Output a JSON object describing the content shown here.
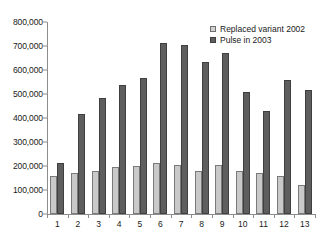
{
  "chart_data": {
    "type": "bar",
    "title": "",
    "subtitle": "",
    "xlabel": "",
    "ylabel": "",
    "categories": [
      "1",
      "2",
      "3",
      "4",
      "5",
      "6",
      "7",
      "8",
      "9",
      "10",
      "11",
      "12",
      "13"
    ],
    "series": [
      {
        "name": "Replaced variant 2002",
        "color": "#c9c9c9",
        "values": [
          160000,
          170000,
          178000,
          195000,
          200000,
          212000,
          205000,
          178000,
          205000,
          180000,
          172000,
          158000,
          120000
        ]
      },
      {
        "name": "Pulse in 2003",
        "color": "#5e5e5e",
        "values": [
          212000,
          415000,
          483000,
          537000,
          567000,
          712000,
          705000,
          635000,
          672000,
          508000,
          430000,
          557000,
          517000
        ]
      }
    ],
    "ylim": [
      0,
      800000
    ],
    "ytick_values": [
      0,
      100000,
      200000,
      300000,
      400000,
      500000,
      600000,
      700000,
      800000
    ],
    "ytick_labels": [
      "0",
      "100,000",
      "200,000",
      "300,000",
      "400,000",
      "500,000",
      "600,000",
      "700,000",
      "800,000"
    ],
    "grid": false,
    "legend_position": "top-right",
    "legend": [
      "Replaced variant 2002",
      "Pulse in 2003"
    ]
  }
}
